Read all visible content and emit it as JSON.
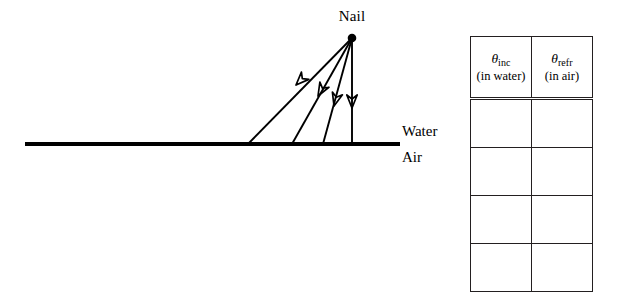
{
  "diagram": {
    "nail_label": "Nail",
    "upper_medium_label": "Water",
    "lower_medium_label": "Air",
    "nail_point": {
      "x": 352,
      "y": 38
    },
    "interface_line": {
      "x1": 25,
      "x2": 400,
      "y": 144,
      "thickness": 4
    },
    "rays": [
      {
        "name": "ray-1",
        "from_x": 352,
        "from_y": 38,
        "to_x": 248,
        "to_y": 144
      },
      {
        "name": "ray-2",
        "from_x": 352,
        "from_y": 38,
        "to_x": 292,
        "to_y": 144
      },
      {
        "name": "ray-3",
        "from_x": 352,
        "from_y": 38,
        "to_x": 323,
        "to_y": 144
      },
      {
        "name": "ray-4",
        "from_x": 352,
        "from_y": 38,
        "to_x": 352,
        "to_y": 144
      }
    ],
    "ink_color": "#000000"
  },
  "table": {
    "columns": [
      {
        "symbol": "θ",
        "subscript": "inc",
        "note": "(in water)"
      },
      {
        "symbol": "θ",
        "subscript": "refr",
        "note": "(in air)"
      }
    ],
    "rows": [
      {
        "col1": "",
        "col2": ""
      },
      {
        "col1": "",
        "col2": ""
      },
      {
        "col1": "",
        "col2": ""
      },
      {
        "col1": "",
        "col2": ""
      }
    ],
    "border_color": "#231f20"
  }
}
